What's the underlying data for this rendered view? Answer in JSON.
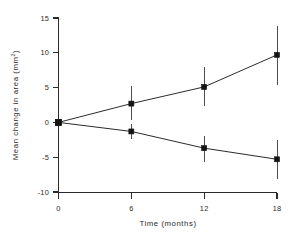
{
  "chart_data": {
    "type": "line",
    "title": "",
    "subtitle": "",
    "xlabel": "Time  (months)",
    "ylabel": "Mean change in area  (mm²)",
    "ylabel_base": "Mean change in area  (mm",
    "ylabel_sup": "2",
    "ylabel_close": ")",
    "x": [
      0,
      6,
      12,
      18
    ],
    "xticklabels": [
      "0",
      "6",
      "12",
      "18"
    ],
    "yticks": [
      15,
      10,
      5,
      0,
      -5,
      -10
    ],
    "yticklabels": [
      "15",
      "10",
      "5",
      "0",
      "-5",
      "-10"
    ],
    "xlim": [
      0,
      18
    ],
    "ylim": [
      -10,
      15
    ],
    "grid": false,
    "legend": "none",
    "errorbars": true,
    "marker": "filled-square",
    "series": [
      {
        "name": "upper",
        "values": [
          0.0,
          2.7,
          5.1,
          9.7
        ],
        "err_low": [
          0.0,
          0.3,
          2.3,
          5.4
        ],
        "err_high": [
          0.0,
          5.2,
          8.0,
          13.9
        ]
      },
      {
        "name": "lower",
        "values": [
          0.0,
          -1.3,
          -3.7,
          -5.3
        ],
        "err_low": [
          0.0,
          -2.4,
          -5.7,
          -8.2
        ],
        "err_high": [
          0.0,
          -0.2,
          -2.0,
          -2.6
        ]
      }
    ]
  },
  "colors": {
    "axis": "#2b2b2b",
    "marker": "#141414",
    "errorbar": "#4d4d4d",
    "background": "#ffffff"
  }
}
